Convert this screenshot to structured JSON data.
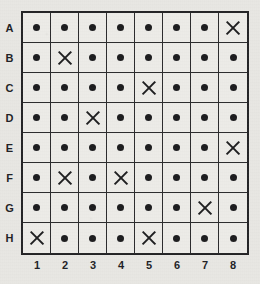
{
  "worksheet": {
    "title": "Grid Worksheet",
    "mark_symbols": {
      "dot": "dot-mark",
      "cross": "cross-mark"
    },
    "colors": {
      "ink": "#131315",
      "grid_line": "#222224",
      "grid_border": "#1b1b1d",
      "paper": "#e9e8e4",
      "cell_fill": "#eeede9"
    }
  },
  "grid": {
    "rows": 8,
    "columns": 8,
    "row_labels": [
      "A",
      "B",
      "C",
      "D",
      "E",
      "F",
      "G",
      "H"
    ],
    "column_labels": [
      "1",
      "2",
      "3",
      "4",
      "5",
      "6",
      "7",
      "8"
    ],
    "cell_width_px": 28,
    "cell_height_px": 30,
    "cells": [
      [
        "dot",
        "dot",
        "dot",
        "dot",
        "dot",
        "dot",
        "dot",
        "cross"
      ],
      [
        "dot",
        "cross",
        "dot",
        "dot",
        "dot",
        "dot",
        "dot",
        "dot"
      ],
      [
        "dot",
        "dot",
        "dot",
        "dot",
        "cross",
        "dot",
        "dot",
        "dot"
      ],
      [
        "dot",
        "dot",
        "cross",
        "dot",
        "dot",
        "dot",
        "dot",
        "dot"
      ],
      [
        "dot",
        "dot",
        "dot",
        "dot",
        "dot",
        "dot",
        "dot",
        "cross"
      ],
      [
        "dot",
        "cross",
        "dot",
        "cross",
        "dot",
        "dot",
        "dot",
        "dot"
      ],
      [
        "dot",
        "dot",
        "dot",
        "dot",
        "dot",
        "dot",
        "cross",
        "dot"
      ],
      [
        "cross",
        "dot",
        "dot",
        "dot",
        "cross",
        "dot",
        "dot",
        "dot"
      ]
    ],
    "cross_positions": [
      "A8",
      "B2",
      "C5",
      "D3",
      "E8",
      "F2",
      "F4",
      "G7",
      "H1",
      "H5"
    ],
    "cross_count": 10,
    "dot_count": 54
  }
}
